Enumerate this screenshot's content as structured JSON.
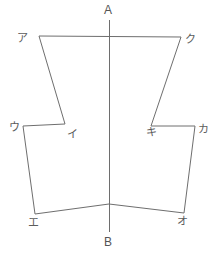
{
  "figure": {
    "canvas": {
      "width": 220,
      "height": 256,
      "background": "#ffffff"
    },
    "stroke": {
      "color": "#6e6e6e",
      "width": 1
    },
    "axis": {
      "name": "center-axis",
      "top_label": "A",
      "bottom_label": "B",
      "x": 109,
      "y_top": 20,
      "y_bottom": 232,
      "top_label_pos": {
        "x": 104,
        "y": 4
      },
      "bottom_label_pos": {
        "x": 104,
        "y": 236
      }
    },
    "vertices": [
      {
        "id": "a",
        "label": "ア",
        "x": 39,
        "y": 36,
        "label_x": 17,
        "label_y": 33
      },
      {
        "id": "ku",
        "label": "ク",
        "x": 181,
        "y": 37,
        "label_x": 185,
        "label_y": 34
      },
      {
        "id": "i",
        "label": "イ",
        "x": 65,
        "y": 124,
        "label_x": 67,
        "label_y": 129
      },
      {
        "id": "ki",
        "label": "キ",
        "x": 151,
        "y": 126,
        "label_x": 146,
        "label_y": 127
      },
      {
        "id": "u",
        "label": "ウ",
        "x": 23,
        "y": 126,
        "label_x": 9,
        "label_y": 122
      },
      {
        "id": "ka",
        "label": "カ",
        "x": 195,
        "y": 126,
        "label_x": 198,
        "label_y": 124
      },
      {
        "id": "e",
        "label": "エ",
        "x": 35,
        "y": 214,
        "label_x": 28,
        "label_y": 217
      },
      {
        "id": "o",
        "label": "オ",
        "x": 184,
        "y": 213,
        "label_x": 177,
        "label_y": 216
      },
      {
        "id": "center_bottom",
        "label": "",
        "x": 109,
        "y": 204,
        "label_x": 0,
        "label_y": 0
      }
    ],
    "paths": {
      "upper_outline": "M 39 36 L 181 37 L 151 126 L 65 124 Z",
      "lower_outline": "M 23 126 L 195 126 L 184 213 L 109 204 L 35 214 Z",
      "upper_top_edge": "M 39 36 L 181 37",
      "upper_left_edge": "M 39 36 L 65 124",
      "upper_right_edge": "M 181 37 L 151 126",
      "lower_left_top": "M 23 126 L 65 124",
      "lower_right_top": "M 151 126 L 195 126",
      "lower_left_edge": "M 23 126 L 35 214",
      "lower_right_edge": "M 195 126 L 184 213",
      "lower_bottom_left": "M 35 214 L 109 204",
      "lower_bottom_right": "M 109 204 L 184 213"
    }
  }
}
